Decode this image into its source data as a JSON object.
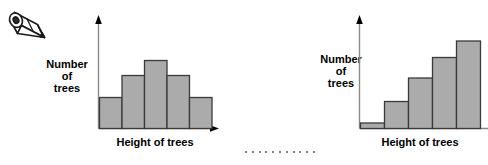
{
  "page": {
    "background_color": "#ffffff",
    "bar_fill_color": "#ababab",
    "bar_stroke_color": "#3a3a3a",
    "axis_color": "#8a8a8a",
    "arrow_color": "#000000",
    "text_color": "#000000"
  },
  "pencil": {
    "icon_name": "pencil-icon",
    "body_color": "#ffffff",
    "outline_color": "#1a1a1a",
    "tip_color": "#4a4a4a"
  },
  "separator": {
    "name": "dotted-separator",
    "dot_count": 11,
    "dot_color": "#555555"
  },
  "charts": [
    {
      "id": "left",
      "y_axis_label_lines": [
        "Number",
        "of",
        "trees"
      ],
      "x_axis_label": "Height of trees",
      "chart_data": {
        "type": "bar",
        "title": "",
        "xlabel": "Height of trees",
        "ylabel": "Number of trees",
        "categories": [
          "1",
          "2",
          "3",
          "4",
          "5"
        ],
        "values": [
          30,
          52,
          68,
          52,
          30
        ],
        "ylim": [
          0,
          100
        ],
        "grid": false,
        "legend": "none",
        "shape_description": "symmetric hill / normal distribution"
      }
    },
    {
      "id": "right",
      "y_axis_label_lines": [
        "Number",
        "of",
        "trees"
      ],
      "x_axis_label": "Height of trees",
      "chart_data": {
        "type": "bar",
        "title": "",
        "xlabel": "Height of trees",
        "ylabel": "Number of trees",
        "categories": [
          "1",
          "2",
          "3",
          "4",
          "5"
        ],
        "values": [
          5,
          27,
          50,
          71,
          88
        ],
        "ylim": [
          0,
          100
        ],
        "grid": false,
        "legend": "none",
        "shape_description": "monotonically increasing / skewed"
      }
    }
  ]
}
